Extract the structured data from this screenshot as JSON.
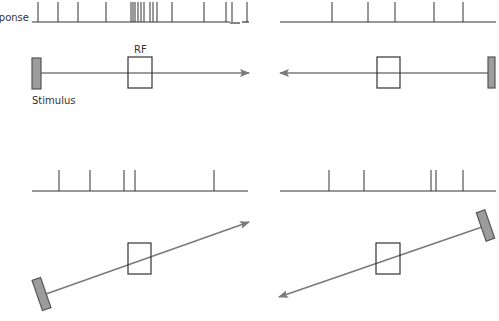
{
  "labels": {
    "response": "sponse",
    "rf": "RF",
    "stimulus": "Stimulus"
  },
  "colors": {
    "baseline": "#333333",
    "spike": "#333333",
    "rf_box": "#333333",
    "arrow": "#7a7a7a",
    "bar_fill": "#9c9c9c",
    "bar_stroke": "#555555"
  },
  "panels": [
    {
      "id": "top-left",
      "baseline": {
        "x1": 32,
        "x2": 249,
        "y": 22,
        "gap": [
          230,
          240
        ]
      },
      "spike_top": 2,
      "spikes": [
        38,
        58,
        78,
        106,
        131,
        133,
        135,
        138,
        141,
        144,
        150,
        153,
        157,
        172,
        204,
        226,
        232,
        247
      ],
      "rf": {
        "x": 128,
        "y": 57,
        "w": 24,
        "h": 31
      },
      "arrow": {
        "x1": 41,
        "y1": 73,
        "x2": 249,
        "y2": 73
      },
      "bar": {
        "cx": 36.5,
        "cy": 73.5,
        "w": 9,
        "h": 31,
        "angle": 0
      }
    },
    {
      "id": "top-right",
      "baseline": {
        "x1": 280,
        "x2": 496,
        "y": 22
      },
      "spike_top": 2,
      "spikes": [
        332,
        368,
        395,
        434,
        463
      ],
      "rf": {
        "x": 377,
        "y": 57,
        "w": 23,
        "h": 31
      },
      "arrow": {
        "x1": 488,
        "y1": 73,
        "x2": 280,
        "y2": 73
      },
      "bar": {
        "cx": 491.5,
        "cy": 72.5,
        "w": 7,
        "h": 31,
        "angle": 0
      }
    },
    {
      "id": "bottom-left",
      "baseline": {
        "x1": 32,
        "x2": 248,
        "y": 191
      },
      "spike_top": 170,
      "spikes": [
        59,
        90,
        124,
        135,
        214
      ],
      "rf": {
        "x": 128,
        "y": 243,
        "w": 23,
        "h": 31
      },
      "arrow": {
        "x1": 46,
        "y1": 294,
        "x2": 249,
        "y2": 222
      },
      "bar": {
        "cx": 41.5,
        "cy": 294,
        "w": 9,
        "h": 32,
        "angle": -19
      }
    },
    {
      "id": "bottom-right",
      "baseline": {
        "x1": 280,
        "x2": 496,
        "y": 191
      },
      "spike_top": 170,
      "spikes": [
        329,
        364,
        431,
        436,
        463
      ],
      "rf": {
        "x": 376,
        "y": 243,
        "w": 24,
        "h": 31
      },
      "arrow": {
        "x1": 482,
        "y1": 227,
        "x2": 279,
        "y2": 297
      },
      "bar": {
        "cx": 485.5,
        "cy": 225.5,
        "w": 9,
        "h": 30,
        "angle": -19
      }
    }
  ]
}
